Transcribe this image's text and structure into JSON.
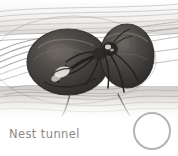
{
  "figure": {
    "type": "naturalist-pencil-illustration",
    "caption": "Nest tunnel",
    "background_color": "#ffffff",
    "caption_color": "#8d8a86",
    "marker": {
      "shape": "circle",
      "fill": "none",
      "stroke_color": "#b6b4b2",
      "label": ""
    },
    "palette": {
      "tunnel_wall_light": "#e8e7e5",
      "tunnel_wall_mid": "#c9c7c4",
      "tunnel_wall_dark": "#9c9a97",
      "mass_dark": "#3a3a3a",
      "mass_mid": "#54514e",
      "mass_highlight": "#7a7570",
      "insect_body": "#2e2c2b",
      "highlight_white": "#f2f0ec"
    },
    "elements": {
      "tunnel_name": "nest tunnel walls",
      "left_mass_name": "dark seed mass left",
      "right_mass_name": "dark seed mass right",
      "insect_name": "ant"
    }
  }
}
